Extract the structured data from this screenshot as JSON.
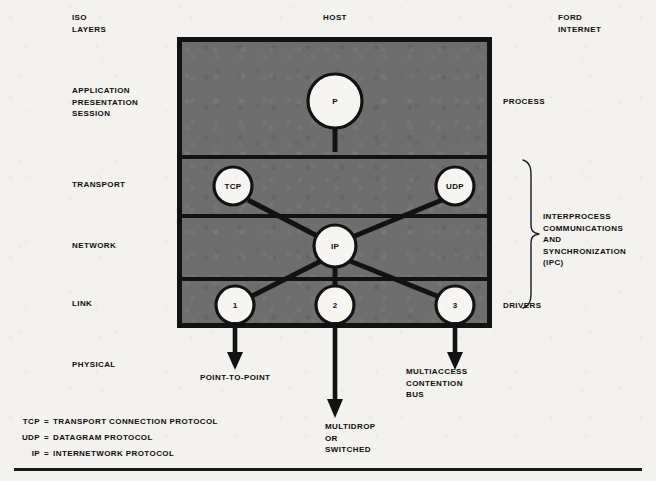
{
  "headers": {
    "left": "ISO\nLAYERS",
    "center": "HOST",
    "right": "FORD\nINTERNET"
  },
  "iso_layers": [
    {
      "id": "application",
      "label": "APPLICATION\nPRESENTATION\nSESSION"
    },
    {
      "id": "transport",
      "label": "TRANSPORT"
    },
    {
      "id": "network",
      "label": "NETWORK"
    },
    {
      "id": "link",
      "label": "LINK"
    },
    {
      "id": "physical",
      "label": "PHYSICAL"
    }
  ],
  "right_labels": {
    "process": "PROCESS",
    "drivers": "DRIVERS",
    "ipc": "INTERPROCESS\nCOMMUNICATIONS\nAND\nSYNCHRONIZATION\n(IPC)"
  },
  "nodes": [
    {
      "id": "process",
      "label": "P",
      "layer": "application"
    },
    {
      "id": "tcp",
      "label": "TCP",
      "layer": "transport"
    },
    {
      "id": "udp",
      "label": "UDP",
      "layer": "transport"
    },
    {
      "id": "ip",
      "label": "IP",
      "layer": "network"
    },
    {
      "id": "driver1",
      "label": "1",
      "layer": "link"
    },
    {
      "id": "driver2",
      "label": "2",
      "layer": "link"
    },
    {
      "id": "driver3",
      "label": "3",
      "layer": "link"
    }
  ],
  "connections": [
    {
      "from": "process",
      "to": "transport-boundary"
    },
    {
      "from": "tcp",
      "to": "ip"
    },
    {
      "from": "udp",
      "to": "ip"
    },
    {
      "from": "ip",
      "to": "driver1"
    },
    {
      "from": "ip",
      "to": "driver2"
    },
    {
      "from": "ip",
      "to": "driver3"
    }
  ],
  "media_labels": [
    {
      "id": "point-to-point",
      "from_node": "driver1",
      "label": "POINT-TO-POINT"
    },
    {
      "id": "multidrop",
      "from_node": "driver2",
      "label": "MULTIDROP\nOR\nSWITCHED"
    },
    {
      "id": "multiaccess",
      "from_node": "driver3",
      "label": "MULTIACCESS\nCONTENTION\nBUS"
    }
  ],
  "legend": [
    {
      "abbr": "TCP",
      "eq": "=",
      "expansion": "TRANSPORT CONNECTION PROTOCOL"
    },
    {
      "abbr": "UDP",
      "eq": "=",
      "expansion": "DATAGRAM PROTOCOL"
    },
    {
      "abbr": "IP",
      "eq": "=",
      "expansion": "INTERNETWORK PROTOCOL"
    }
  ],
  "colors": {
    "paper": "#f4f2ee",
    "host_fill": "#6e6e6e",
    "ink": "#121212",
    "node_fill": "#f7f5f1"
  }
}
